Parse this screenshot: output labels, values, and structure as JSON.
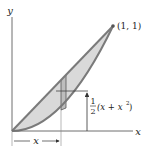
{
  "figure": {
    "axes": {
      "x_label": "x",
      "y_label": "y"
    },
    "curves": {
      "upper": "y = x",
      "lower": "y = x^2"
    },
    "point_label": "(1, 1)",
    "strip_height_label": {
      "fraction_num": "1",
      "fraction_den": "2",
      "expression_open": "(x + x",
      "exponent": "2",
      "expression_close": ")"
    },
    "distance_label": "x",
    "colors": {
      "region_fill": "#d9d9d9",
      "curve_stroke": "#7a7a7a",
      "axis_stroke": "#6e6e6e",
      "strip_fill": "#bdbdbd",
      "text": "#222222"
    }
  }
}
